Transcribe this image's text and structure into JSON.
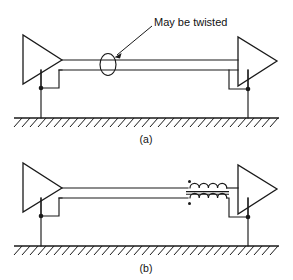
{
  "figure": {
    "caption_a": "(a)",
    "caption_b": "(b)",
    "annotation": "May be twisted"
  },
  "diagram_a": {
    "name": "direct-coupled-differential-line",
    "caption": "(a)",
    "annotation_label": "May be twisted",
    "components": [
      {
        "type": "amplifier",
        "role": "driver",
        "side": "left"
      },
      {
        "type": "amplifier",
        "role": "receiver",
        "side": "right"
      },
      {
        "type": "signal-pair",
        "role": "transmission-line"
      },
      {
        "type": "twist-indicator",
        "role": "may-be-twisted-marker"
      },
      {
        "type": "ground-symbol",
        "role": "earth-reference"
      },
      {
        "type": "junction",
        "role": "ground-node-left"
      },
      {
        "type": "junction",
        "role": "ground-node-right"
      }
    ]
  },
  "diagram_b": {
    "name": "transformer-coupled-differential-line",
    "caption": "(b)",
    "components": [
      {
        "type": "amplifier",
        "role": "driver",
        "side": "left"
      },
      {
        "type": "amplifier",
        "role": "receiver",
        "side": "right"
      },
      {
        "type": "signal-pair",
        "role": "transmission-line"
      },
      {
        "type": "transformer",
        "role": "isolation-transformer",
        "windings": 2,
        "polarity_dots": 2
      },
      {
        "type": "ground-symbol",
        "role": "earth-reference"
      },
      {
        "type": "junction",
        "role": "ground-node-left"
      },
      {
        "type": "junction",
        "role": "ground-node-right"
      }
    ]
  },
  "colors": {
    "ink": "#1a1a1a",
    "text": "#111111",
    "background": "#ffffff"
  }
}
